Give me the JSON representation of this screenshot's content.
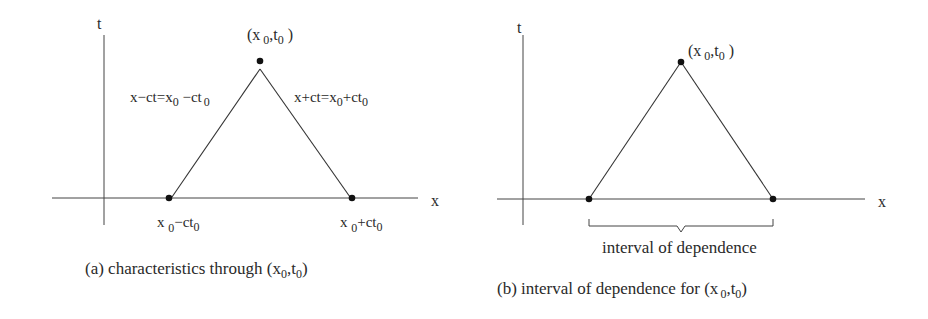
{
  "colors": {
    "ink": "#2a2a2a",
    "line": "#333333",
    "background": "#ffffff"
  },
  "panel_a": {
    "axis_t_label": "t",
    "axis_x_label": "x",
    "apex_label": {
      "main": "(x",
      "sub1": "0",
      "mid": ",t",
      "sub2": "0",
      "end": " )"
    },
    "left_line_label": {
      "p1": "x−ct=x",
      "s1": "0",
      "p2": " −ct",
      "s2": "0"
    },
    "right_line_label": {
      "p1": "x+ct=x",
      "s1": "0",
      "p2": "+ct",
      "s2": "0"
    },
    "left_foot_label": {
      "p1": "x ",
      "s1": "0",
      "p2": "−ct",
      "s2": "0"
    },
    "right_foot_label": {
      "p1": "x ",
      "s1": "0",
      "p2": "+ct",
      "s2": "0"
    },
    "caption": {
      "p1": "(a)  characteristics through (x",
      "s1": "0",
      "p2": ",t",
      "s2": "0",
      "p3": ")"
    }
  },
  "panel_b": {
    "axis_t_label": "t",
    "axis_x_label": "x",
    "apex_label": {
      "main": "(x",
      "sub1": "0",
      "mid": ",t",
      "sub2": "0",
      "end": " )"
    },
    "brace_label": "interval of dependence",
    "caption": {
      "p1": "(b)  interval of dependence for (x",
      "s1": "0",
      "p2": ",t",
      "s2": "0",
      "p3": ")"
    }
  }
}
